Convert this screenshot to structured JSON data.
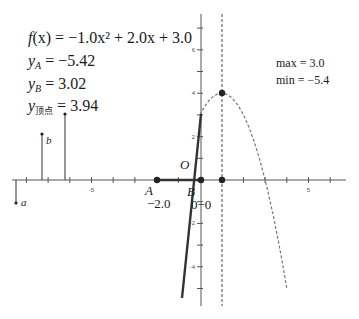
{
  "formulas": {
    "function": {
      "prefix": "f",
      "arg": "(x)",
      "rhs": " = −1.0x² + 2.0x + 3.0"
    },
    "y_A": {
      "var": "y",
      "sub": "A",
      "rhs": " = −5.42"
    },
    "y_B": {
      "var": "y",
      "sub": "B",
      "rhs": " = 3.02"
    },
    "y_vertex": {
      "var": "y",
      "sub": "顶点",
      "rhs": " = 3.94"
    }
  },
  "stats": {
    "max": "max = 3.0",
    "min": "min = −5.4"
  },
  "labels": {
    "point_A": "A",
    "point_A_value": "−2.0",
    "point_B": "B",
    "point_B_value": "0−0",
    "origin": "O",
    "stem_a": "a",
    "stem_b": "b"
  },
  "axes": {
    "x_tick_labels": [
      {
        "value": -5,
        "text": "-5"
      },
      {
        "value": 5,
        "text": "5"
      }
    ],
    "y_tick_labels": [
      {
        "value": 6,
        "text": "6"
      },
      {
        "value": 4,
        "text": "4"
      },
      {
        "value": 2,
        "text": "2"
      },
      {
        "value": -2,
        "text": "-2"
      },
      {
        "value": -4,
        "text": "-4"
      }
    ]
  },
  "geometry": {
    "origin_px": [
      200,
      180
    ],
    "unit_px": 21.7,
    "parabola": {
      "a": -1.0,
      "b": 2.0,
      "c": 3.0
    },
    "solid_segment_x_range": [
      -0.85,
      0.0
    ],
    "dashed_curve_x_range": [
      0.0,
      4.0
    ],
    "vertex": [
      1.0,
      4.0
    ],
    "axis_of_symmetry_x": 1.0,
    "point_A_x": -2.0,
    "point_B_x": 0.0,
    "stems": [
      {
        "name": "a",
        "x_px": 16,
        "top_px": 180,
        "end_px": 203
      },
      {
        "name": "b",
        "x_px": 42,
        "top_px": 180,
        "end_px": 134
      },
      {
        "name": "c",
        "x_px": 65,
        "top_px": 180,
        "end_px": 114
      }
    ]
  },
  "colors": {
    "axis": "#555555",
    "curve": "#333333",
    "dashed": "#777777",
    "point": "#222222"
  }
}
